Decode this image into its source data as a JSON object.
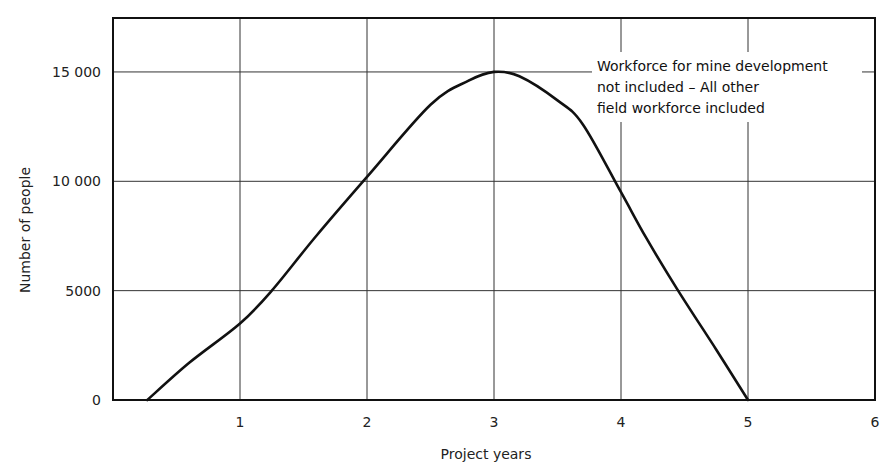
{
  "chart_data": {
    "type": "line",
    "title": "",
    "xlabel": "Project years",
    "ylabel": "Number of people",
    "xlim": [
      0,
      6
    ],
    "ylim": [
      0,
      17000
    ],
    "grid": true,
    "x_ticks": [
      "1",
      "2",
      "3",
      "4",
      "5",
      "6"
    ],
    "y_ticks": [
      "0",
      "5000",
      "10 000",
      "15 000"
    ],
    "annotation": [
      "Workforce for mine development",
      "not included – All other",
      "field workforce included"
    ],
    "series": [
      {
        "name": "Field workforce",
        "x": [
          0.27,
          0.6,
          1.0,
          1.25,
          1.6,
          2.0,
          2.5,
          2.8,
          3.0,
          3.2,
          3.5,
          3.7,
          4.0,
          4.2,
          4.45,
          4.75,
          5.0
        ],
        "y": [
          0,
          1700,
          3500,
          5000,
          7500,
          10200,
          13500,
          14600,
          15000,
          14800,
          13700,
          12600,
          9500,
          7400,
          5000,
          2300,
          0
        ]
      }
    ]
  }
}
